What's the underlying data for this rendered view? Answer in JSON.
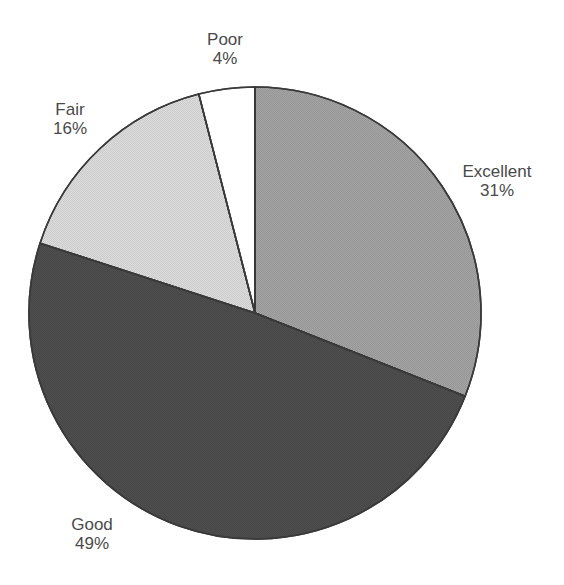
{
  "chart_data": {
    "type": "pie",
    "title": "",
    "start_angle_deg": 0,
    "direction": "clockwise",
    "center": [
      255,
      313
    ],
    "radius": 226,
    "slices": [
      {
        "name": "Excellent",
        "value": 31,
        "label": "31%",
        "color": "#a3a3a3",
        "label_pos": [
          497,
          162
        ]
      },
      {
        "name": "Good",
        "value": 49,
        "label": "49%",
        "color": "#4d4d4d",
        "label_pos": [
          92,
          515
        ]
      },
      {
        "name": "Fair",
        "value": 16,
        "label": "16%",
        "color": "#dcdcdc",
        "label_pos": [
          70,
          100
        ]
      },
      {
        "name": "Poor",
        "value": 4,
        "label": "4%",
        "color": "#ffffff",
        "label_pos": [
          225,
          30
        ]
      }
    ],
    "legend": null,
    "grid": false
  },
  "labels": {
    "excellent": {
      "name": "Excellent",
      "pct": "31%"
    },
    "good": {
      "name": "Good",
      "pct": "49%"
    },
    "fair": {
      "name": "Fair",
      "pct": "16%"
    },
    "poor": {
      "name": "Poor",
      "pct": "4%"
    }
  }
}
